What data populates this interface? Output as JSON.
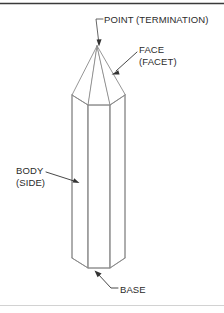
{
  "page": {
    "background_color": "#ffffff",
    "width": 224,
    "height": 313
  },
  "borders": {
    "top_rule_color": "#3a3a3a",
    "bottom_rule_color": "#cfcfcf"
  },
  "figure": {
    "name": "hexagonal-crystal",
    "line_color": "#8a8a8a",
    "fill_color": "#ffffff",
    "apex": {
      "x": 97,
      "y": 46
    },
    "shoulder_y": 95,
    "base_y": 258,
    "left_x": 72,
    "right_x": 125
  },
  "annotations": {
    "point": {
      "name": "point-termination",
      "text": "POINT (TERMINATION)",
      "leader_color": "#555555",
      "arrow_target": {
        "x": 99,
        "y": 46
      }
    },
    "face": {
      "name": "face-facet",
      "line1": "FACE",
      "line2": "(FACET)",
      "leader_color": "#333333",
      "arrow_target": {
        "x": 112,
        "y": 74
      }
    },
    "body": {
      "name": "body-side",
      "line1": "BODY",
      "line2": "(SIDE)",
      "leader_color": "#333333",
      "arrow_target": {
        "x": 79,
        "y": 183
      }
    },
    "base": {
      "name": "base",
      "text": "BASE",
      "leader_color": "#333333",
      "arrow_target": {
        "x": 95,
        "y": 270
      }
    }
  }
}
